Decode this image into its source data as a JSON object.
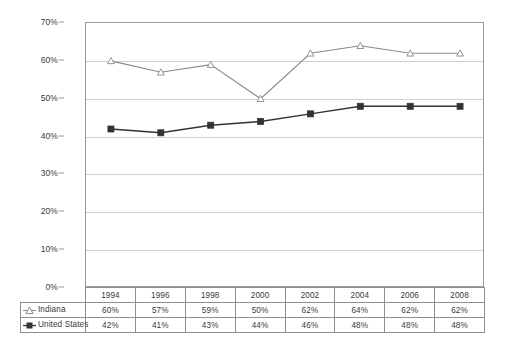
{
  "chart_data": {
    "type": "line",
    "title": "",
    "subtitle": "",
    "xlabel": "",
    "ylabel": "",
    "ylim": [
      0,
      70
    ],
    "grid": true,
    "legend_position": "data-table-left",
    "categories": [
      "1994",
      "1996",
      "1998",
      "2000",
      "2002",
      "2004",
      "2006",
      "2008"
    ],
    "ytick_labels": [
      "0%",
      "10%",
      "20%",
      "30%",
      "40%",
      "50%",
      "60%",
      "70%"
    ],
    "ytick_values": [
      0,
      10,
      20,
      30,
      40,
      50,
      60,
      70
    ],
    "series": [
      {
        "name": "Indiana",
        "marker": "triangle-open",
        "color": "#8a8a8a",
        "values": [
          60,
          57,
          59,
          50,
          62,
          64,
          62,
          62
        ],
        "labels": [
          "60%",
          "57%",
          "59%",
          "50%",
          "62%",
          "64%",
          "62%",
          "62%"
        ]
      },
      {
        "name": "United States",
        "marker": "square-filled",
        "color": "#333333",
        "values": [
          42,
          41,
          43,
          44,
          46,
          48,
          48,
          48
        ],
        "labels": [
          "42%",
          "41%",
          "43%",
          "44%",
          "46%",
          "48%",
          "48%",
          "48%"
        ]
      }
    ]
  },
  "colors": {
    "indiana": "#8a8a8a",
    "united_states": "#333333",
    "gridline": "#d0d0d0",
    "axis": "#9a9a9a",
    "table_border": "#8f8f8f",
    "text": "#3a3a3a"
  }
}
